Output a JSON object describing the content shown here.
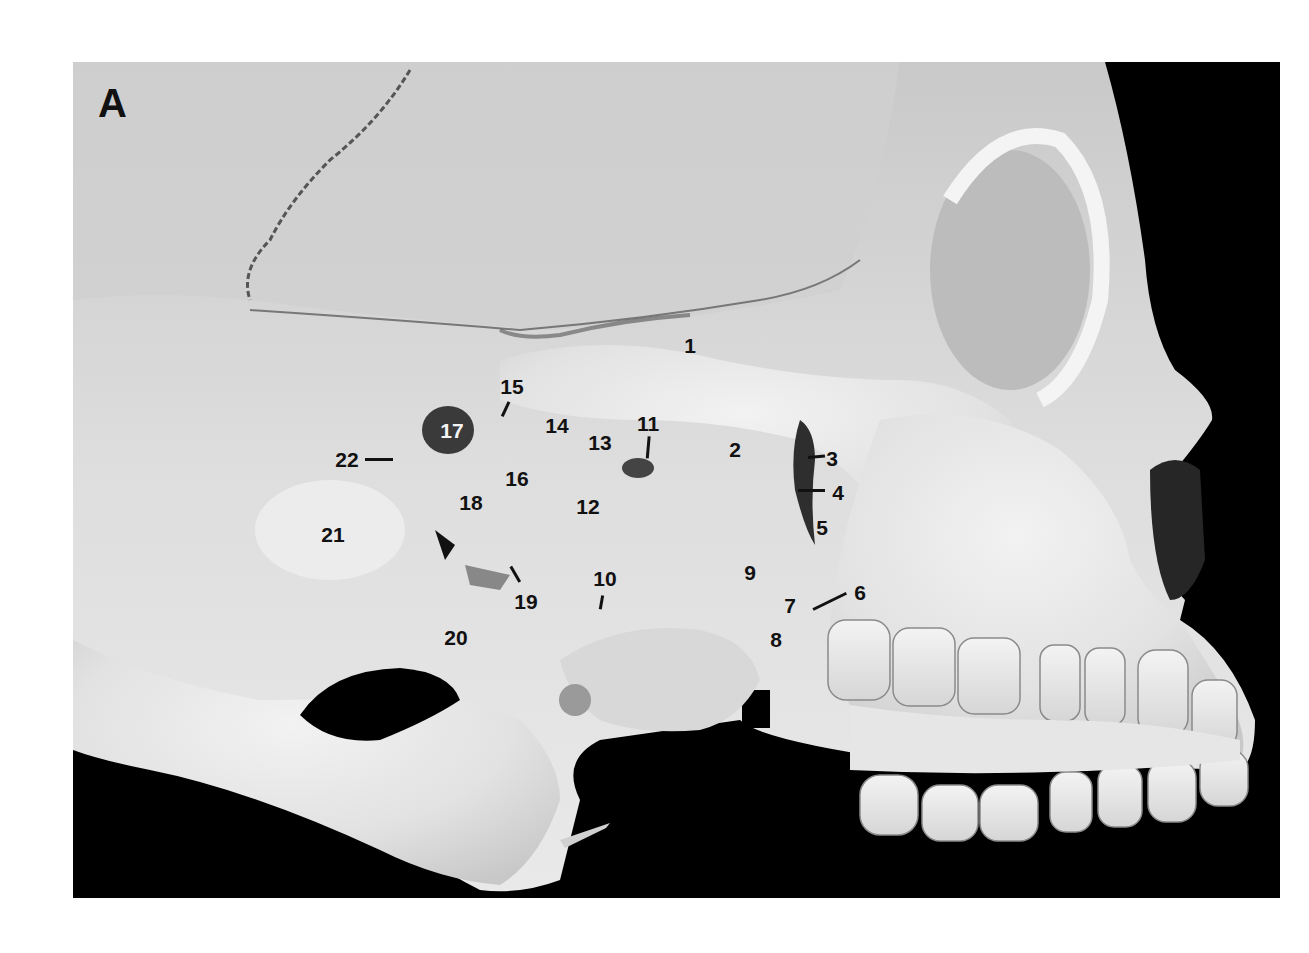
{
  "figure": {
    "panel_letter": "A",
    "background_color": "#000000",
    "bone_color": "#e6e6e6",
    "labels": [
      {
        "id": "1",
        "text": "1",
        "x": 690,
        "y": 345
      },
      {
        "id": "2",
        "text": "2",
        "x": 735,
        "y": 449
      },
      {
        "id": "3",
        "text": "3",
        "x": 832,
        "y": 458
      },
      {
        "id": "4",
        "text": "4",
        "x": 838,
        "y": 492
      },
      {
        "id": "5",
        "text": "5",
        "x": 822,
        "y": 527
      },
      {
        "id": "6",
        "text": "6",
        "x": 860,
        "y": 592
      },
      {
        "id": "7",
        "text": "7",
        "x": 790,
        "y": 605
      },
      {
        "id": "8",
        "text": "8",
        "x": 776,
        "y": 639
      },
      {
        "id": "9",
        "text": "9",
        "x": 750,
        "y": 572
      },
      {
        "id": "10",
        "text": "10",
        "x": 605,
        "y": 578
      },
      {
        "id": "11",
        "text": "11",
        "x": 648,
        "y": 423
      },
      {
        "id": "12",
        "text": "12",
        "x": 588,
        "y": 506
      },
      {
        "id": "13",
        "text": "13",
        "x": 600,
        "y": 442
      },
      {
        "id": "14",
        "text": "14",
        "x": 557,
        "y": 425
      },
      {
        "id": "15",
        "text": "15",
        "x": 512,
        "y": 386
      },
      {
        "id": "16",
        "text": "16",
        "x": 517,
        "y": 478
      },
      {
        "id": "17",
        "text": "17",
        "x": 452,
        "y": 430
      },
      {
        "id": "18",
        "text": "18",
        "x": 471,
        "y": 502
      },
      {
        "id": "19",
        "text": "19",
        "x": 526,
        "y": 601
      },
      {
        "id": "20",
        "text": "20",
        "x": 456,
        "y": 637
      },
      {
        "id": "21",
        "text": "21",
        "x": 333,
        "y": 534
      },
      {
        "id": "22",
        "text": "22",
        "x": 347,
        "y": 459
      }
    ]
  }
}
